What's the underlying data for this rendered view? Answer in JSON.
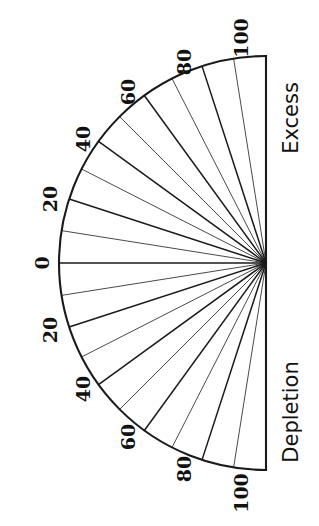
{
  "figure": {
    "type": "semicircular-gauge",
    "orientation_deg": 90,
    "background_color": "#ffffff",
    "stroke_color": "#1a1a1a",
    "minor_stroke_color": "#4a4a4a",
    "center": {
      "x": 266,
      "y": 263
    },
    "radius": 207,
    "arc": {
      "start_angle_deg": -90,
      "end_angle_deg": 90,
      "outline_width": 2.1
    },
    "baseline": {
      "name": "vertical-diameter",
      "x": 266,
      "y_top": 56,
      "y_bottom": 470,
      "width": 2.1
    },
    "zero_spoke": {
      "name": "zero-radius-line",
      "from": {
        "x": 266,
        "y": 263
      },
      "to": {
        "x": 59,
        "y": 263
      },
      "width": 1.6
    }
  },
  "axis_labels": {
    "upper": "Excess",
    "lower": "Depletion"
  },
  "scale": {
    "min": 0,
    "max": 100,
    "label_step": 20,
    "minor_step": 10,
    "units": "percent",
    "zero_label": "0",
    "labeled_ticks": [
      0,
      20,
      40,
      60,
      80,
      100
    ],
    "minor_ticks": [
      10,
      30,
      50,
      70,
      90
    ]
  },
  "chart_data": {
    "type": "pie",
    "title": "",
    "subtitle": "",
    "xlabel": "",
    "ylabel": "",
    "legend_position": "none",
    "grid": false,
    "categories": [
      "Depletion",
      "Excess"
    ],
    "axis_ranges": {
      "angle_deg": [
        -90,
        90
      ],
      "value": [
        0,
        100
      ]
    },
    "annotations": [
      "Excess",
      "Depletion"
    ],
    "tick_labels_excess": [
      "0",
      "20",
      "40",
      "60",
      "80",
      "100"
    ],
    "tick_labels_depletion": [
      "0",
      "20",
      "40",
      "60",
      "80",
      "100"
    ],
    "values": [
      100,
      100
    ],
    "spokes_deg_excess": [
      0,
      9,
      18,
      27,
      36,
      45,
      54,
      63,
      72,
      81,
      90
    ],
    "spokes_deg_depletion": [
      0,
      -9,
      -18,
      -27,
      -36,
      -45,
      -54,
      -63,
      -72,
      -81,
      -90
    ]
  },
  "ticks": {
    "excess": [
      {
        "value": "0",
        "angle_deg": 0,
        "x": 44,
        "y": 263,
        "rot": -90,
        "major": true
      },
      {
        "value": "20",
        "angle_deg": 18,
        "x": 52,
        "y": 199,
        "rot": -90,
        "major": true
      },
      {
        "value": "40",
        "angle_deg": 36,
        "x": 85,
        "y": 139,
        "rot": -90,
        "major": true
      },
      {
        "value": "60",
        "angle_deg": 54,
        "x": 130,
        "y": 92,
        "rot": -90,
        "major": true
      },
      {
        "value": "80",
        "angle_deg": 72,
        "x": 186,
        "y": 62,
        "rot": -90,
        "major": true
      },
      {
        "value": "100",
        "angle_deg": 90,
        "x": 243,
        "y": 38,
        "rot": -90,
        "major": true
      }
    ],
    "depletion": [
      {
        "value": "20",
        "angle_deg": -18,
        "x": 52,
        "y": 330,
        "rot": -90,
        "major": true
      },
      {
        "value": "40",
        "angle_deg": -36,
        "x": 85,
        "y": 389,
        "rot": -90,
        "major": true
      },
      {
        "value": "60",
        "angle_deg": -54,
        "x": 130,
        "y": 437,
        "rot": -90,
        "major": true
      },
      {
        "value": "80",
        "angle_deg": -72,
        "x": 186,
        "y": 469,
        "rot": -90,
        "major": true
      },
      {
        "value": "100",
        "angle_deg": -90,
        "x": 243,
        "y": 493,
        "rot": -90,
        "major": true
      }
    ]
  }
}
